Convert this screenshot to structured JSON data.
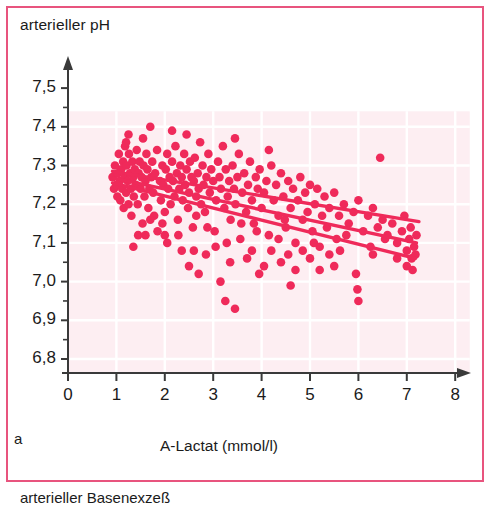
{
  "figure": {
    "panel_letter": "a",
    "frame_color": "#e8547e",
    "plot_bg_color": "#fdeef2",
    "grid_color": "#ffffff",
    "marker_color": "#ef2a5a",
    "line_color": "#ef2a5a",
    "axis_color": "#3a3a3a",
    "caption_below": "arterieller Basenexzeß"
  },
  "chart_data": {
    "type": "scatter",
    "title": "",
    "ylabel": "arterieller pH",
    "xlabel": "A-Lactat (mmol/l)",
    "xlim": [
      0,
      8.3
    ],
    "ylim": [
      6.75,
      7.56
    ],
    "xticks": [
      0,
      1,
      2,
      3,
      4,
      5,
      6,
      7,
      8
    ],
    "xticklabels": [
      "0",
      "1",
      "2",
      "3",
      "4",
      "5",
      "6",
      "7",
      "8"
    ],
    "yticks": [
      6.8,
      6.9,
      7.0,
      7.1,
      7.2,
      7.3,
      7.4,
      7.5
    ],
    "yticklabels": [
      "6,8",
      "6,9",
      "7,0",
      "7,1",
      "7,2",
      "7,3",
      "7,4",
      "7,5"
    ],
    "grid": true,
    "legend": null,
    "marker_radius_px": 4.3,
    "points": [
      [
        0.92,
        7.27
      ],
      [
        0.95,
        7.24
      ],
      [
        0.97,
        7.3
      ],
      [
        1.0,
        7.25
      ],
      [
        1.02,
        7.22
      ],
      [
        1.03,
        7.28
      ],
      [
        1.05,
        7.33
      ],
      [
        1.07,
        7.26
      ],
      [
        1.08,
        7.21
      ],
      [
        1.1,
        7.29
      ],
      [
        1.12,
        7.24
      ],
      [
        1.14,
        7.31
      ],
      [
        1.15,
        7.19
      ],
      [
        1.17,
        7.27
      ],
      [
        1.18,
        7.35
      ],
      [
        1.2,
        7.23
      ],
      [
        1.21,
        7.3
      ],
      [
        1.23,
        7.26
      ],
      [
        1.25,
        7.2
      ],
      [
        1.26,
        7.33
      ],
      [
        1.28,
        7.28
      ],
      [
        1.3,
        7.24
      ],
      [
        1.31,
        7.17
      ],
      [
        1.33,
        7.31
      ],
      [
        1.35,
        7.27
      ],
      [
        1.36,
        7.22
      ],
      [
        1.38,
        7.29
      ],
      [
        1.4,
        7.25
      ],
      [
        1.42,
        7.34
      ],
      [
        1.44,
        7.2
      ],
      [
        1.46,
        7.28
      ],
      [
        1.48,
        7.31
      ],
      [
        1.5,
        7.24
      ],
      [
        1.52,
        7.27
      ],
      [
        1.54,
        7.15
      ],
      [
        1.56,
        7.3
      ],
      [
        1.58,
        7.22
      ],
      [
        1.6,
        7.26
      ],
      [
        1.62,
        7.33
      ],
      [
        1.64,
        7.29
      ],
      [
        1.66,
        7.19
      ],
      [
        1.68,
        7.24
      ],
      [
        1.7,
        7.4
      ],
      [
        1.72,
        7.27
      ],
      [
        1.74,
        7.31
      ],
      [
        1.76,
        7.23
      ],
      [
        1.78,
        7.17
      ],
      [
        1.8,
        7.28
      ],
      [
        1.2,
        7.36
      ],
      [
        1.55,
        7.37
      ],
      [
        1.84,
        7.34
      ],
      [
        1.9,
        7.26
      ],
      [
        1.92,
        7.21
      ],
      [
        1.95,
        7.3
      ],
      [
        1.97,
        7.25
      ],
      [
        2.0,
        7.18
      ],
      [
        2.02,
        7.29
      ],
      [
        2.05,
        7.33
      ],
      [
        2.07,
        7.24
      ],
      [
        2.1,
        7.27
      ],
      [
        2.12,
        7.2
      ],
      [
        2.15,
        7.31
      ],
      [
        2.17,
        7.26
      ],
      [
        2.2,
        7.22
      ],
      [
        2.22,
        7.35
      ],
      [
        2.25,
        7.28
      ],
      [
        2.27,
        7.16
      ],
      [
        2.3,
        7.24
      ],
      [
        2.32,
        7.3
      ],
      [
        2.35,
        7.27
      ],
      [
        2.37,
        7.21
      ],
      [
        2.4,
        7.33
      ],
      [
        2.42,
        7.25
      ],
      [
        2.45,
        7.29
      ],
      [
        2.48,
        7.19
      ],
      [
        2.5,
        7.23
      ],
      [
        2.52,
        7.31
      ],
      [
        2.55,
        7.27
      ],
      [
        2.58,
        7.14
      ],
      [
        2.6,
        7.26
      ],
      [
        2.62,
        7.32
      ],
      [
        2.65,
        7.22
      ],
      [
        2.68,
        7.28
      ],
      [
        2.7,
        7.24
      ],
      [
        2.73,
        7.36
      ],
      [
        2.75,
        7.2
      ],
      [
        2.78,
        7.3
      ],
      [
        2.8,
        7.25
      ],
      [
        2.83,
        7.18
      ],
      [
        2.86,
        7.27
      ],
      [
        2.9,
        7.33
      ],
      [
        2.93,
        7.23
      ],
      [
        2.96,
        7.29
      ],
      [
        3.0,
        7.26
      ],
      [
        3.03,
        7.13
      ],
      [
        3.06,
        7.21
      ],
      [
        3.1,
        7.31
      ],
      [
        3.13,
        7.27
      ],
      [
        3.16,
        7.24
      ],
      [
        3.2,
        7.35
      ],
      [
        3.23,
        7.19
      ],
      [
        3.26,
        7.29
      ],
      [
        3.3,
        7.22
      ],
      [
        3.33,
        7.26
      ],
      [
        3.36,
        7.16
      ],
      [
        3.4,
        7.3
      ],
      [
        3.43,
        7.24
      ],
      [
        3.46,
        7.2
      ],
      [
        3.5,
        7.27
      ],
      [
        3.53,
        7.33
      ],
      [
        3.56,
        7.11
      ],
      [
        3.6,
        7.23
      ],
      [
        3.64,
        7.28
      ],
      [
        3.68,
        7.18
      ],
      [
        3.72,
        7.25
      ],
      [
        3.76,
        7.31
      ],
      [
        3.8,
        7.21
      ],
      [
        3.84,
        7.15
      ],
      [
        3.88,
        7.27
      ],
      [
        3.92,
        7.24
      ],
      [
        3.96,
        7.29
      ],
      [
        4.0,
        7.19
      ],
      [
        4.05,
        7.23
      ],
      [
        4.1,
        7.26
      ],
      [
        4.15,
        7.12
      ],
      [
        4.2,
        7.3
      ],
      [
        4.25,
        7.21
      ],
      [
        4.3,
        7.25
      ],
      [
        4.35,
        7.17
      ],
      [
        4.4,
        7.28
      ],
      [
        4.45,
        7.22
      ],
      [
        4.5,
        7.14
      ],
      [
        4.55,
        7.26
      ],
      [
        4.6,
        7.19
      ],
      [
        4.65,
        7.24
      ],
      [
        4.7,
        7.1
      ],
      [
        4.75,
        7.21
      ],
      [
        4.8,
        7.27
      ],
      [
        4.85,
        7.16
      ],
      [
        4.9,
        7.23
      ],
      [
        4.95,
        7.18
      ],
      [
        5.0,
        7.25
      ],
      [
        5.05,
        7.13
      ],
      [
        5.1,
        7.2
      ],
      [
        5.15,
        7.24
      ],
      [
        5.2,
        7.09
      ],
      [
        5.25,
        7.17
      ],
      [
        5.3,
        7.22
      ],
      [
        5.35,
        7.14
      ],
      [
        5.4,
        7.19
      ],
      [
        5.5,
        7.23
      ],
      [
        5.55,
        7.11
      ],
      [
        5.6,
        7.17
      ],
      [
        5.7,
        7.2
      ],
      [
        5.8,
        7.15
      ],
      [
        5.9,
        7.18
      ],
      [
        6.0,
        7.21
      ],
      [
        6.1,
        7.13
      ],
      [
        6.2,
        7.17
      ],
      [
        6.3,
        7.19
      ],
      [
        6.4,
        7.14
      ],
      [
        6.5,
        7.16
      ],
      [
        6.6,
        7.12
      ],
      [
        6.7,
        7.15
      ],
      [
        6.8,
        7.1
      ],
      [
        6.9,
        7.13
      ],
      [
        7.0,
        7.08
      ],
      [
        7.05,
        7.11
      ],
      [
        7.1,
        7.06
      ],
      [
        7.15,
        7.09
      ],
      [
        7.18,
        7.07
      ],
      [
        7.2,
        7.12
      ],
      [
        1.35,
        7.09
      ],
      [
        2.05,
        7.1
      ],
      [
        2.6,
        7.08
      ],
      [
        3.05,
        7.09
      ],
      [
        3.25,
        6.95
      ],
      [
        3.35,
        7.05
      ],
      [
        3.45,
        6.93
      ],
      [
        3.7,
        7.06
      ],
      [
        3.95,
        7.02
      ],
      [
        4.05,
        7.04
      ],
      [
        4.4,
        7.05
      ],
      [
        4.55,
        7.07
      ],
      [
        4.6,
        6.99
      ],
      [
        4.7,
        7.03
      ],
      [
        5.0,
        7.06
      ],
      [
        5.2,
        7.03
      ],
      [
        5.5,
        7.04
      ],
      [
        5.95,
        7.02
      ],
      [
        5.98,
        6.98
      ],
      [
        6.45,
        7.32
      ],
      [
        6.0,
        6.95
      ],
      [
        2.85,
        7.07
      ],
      [
        3.15,
        7.0
      ],
      [
        2.35,
        7.08
      ],
      [
        2.0,
        7.12
      ],
      [
        1.85,
        7.13
      ],
      [
        1.6,
        7.12
      ],
      [
        2.5,
        7.04
      ],
      [
        2.7,
        7.02
      ],
      [
        3.8,
        7.08
      ],
      [
        4.2,
        7.08
      ],
      [
        4.85,
        7.08
      ],
      [
        5.4,
        7.07
      ],
      [
        6.8,
        7.06
      ],
      [
        7.0,
        7.04
      ],
      [
        7.12,
        7.03
      ],
      [
        1.25,
        7.38
      ],
      [
        2.45,
        7.38
      ],
      [
        3.45,
        7.37
      ],
      [
        4.15,
        7.34
      ],
      [
        2.15,
        7.39
      ],
      [
        1.7,
        7.16
      ],
      [
        2.28,
        7.12
      ],
      [
        2.88,
        7.14
      ],
      [
        3.58,
        7.15
      ],
      [
        4.35,
        7.11
      ],
      [
        5.62,
        7.08
      ],
      [
        6.25,
        7.09
      ],
      [
        1.45,
        7.12
      ],
      [
        1.95,
        7.15
      ],
      [
        2.65,
        7.17
      ],
      [
        3.28,
        7.1
      ],
      [
        3.9,
        7.13
      ],
      [
        4.48,
        7.16
      ],
      [
        5.08,
        7.1
      ],
      [
        5.75,
        7.12
      ],
      [
        6.55,
        7.11
      ],
      [
        7.08,
        7.14
      ],
      [
        6.95,
        7.17
      ],
      [
        6.3,
        7.07
      ]
    ],
    "regression_lines": [
      {
        "name": "upper-fit",
        "x0": 0.92,
        "y0": 7.285,
        "x1": 7.25,
        "y1": 7.155
      },
      {
        "name": "middle-fit",
        "x0": 0.92,
        "y0": 7.268,
        "x1": 7.2,
        "y1": 7.1
      },
      {
        "name": "lower-fit",
        "x0": 0.92,
        "y0": 7.255,
        "x1": 7.18,
        "y1": 7.06
      }
    ]
  }
}
